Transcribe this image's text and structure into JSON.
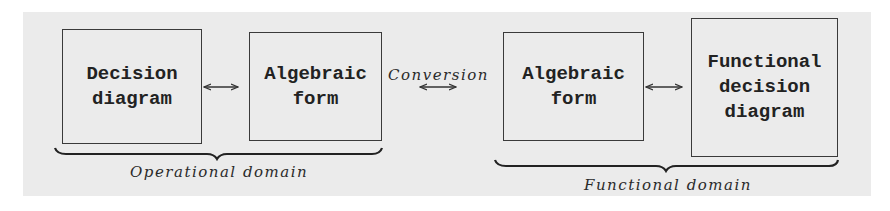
{
  "diagram": {
    "boxes": [
      {
        "id": "decision-diagram",
        "label": "Decision\ndiagram"
      },
      {
        "id": "algebraic-form-operational",
        "label": "Algebraic\nform"
      },
      {
        "id": "algebraic-form-functional",
        "label": "Algebraic\nform"
      },
      {
        "id": "functional-decision-diagram",
        "label": "Functional\ndecision\ndiagram"
      }
    ],
    "conversion_label": "Conversion",
    "groups": [
      {
        "id": "operational",
        "label": "Operational domain"
      },
      {
        "id": "functional",
        "label": "Functional domain"
      }
    ],
    "arrows": [
      {
        "from": "decision-diagram",
        "to": "algebraic-form-operational",
        "type": "bidirectional"
      },
      {
        "from": "algebraic-form-operational",
        "to": "algebraic-form-functional",
        "type": "bidirectional",
        "label": "Conversion"
      },
      {
        "from": "algebraic-form-functional",
        "to": "functional-decision-diagram",
        "type": "bidirectional"
      }
    ]
  }
}
